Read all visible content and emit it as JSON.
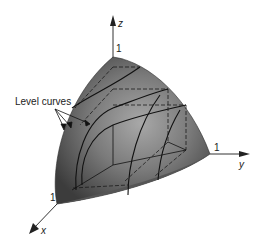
{
  "figure": {
    "annotation": "Level curves",
    "axes": {
      "x": {
        "label": "x",
        "tick": "1"
      },
      "y": {
        "label": "y",
        "tick": "1"
      },
      "z": {
        "label": "z",
        "tick": "1"
      }
    },
    "level_curve_count": 3,
    "colors": {
      "surface_dark": "#3a3a3a",
      "surface_light": "#9a9a9a",
      "curve": "#111111",
      "axis": "#333333",
      "background": "#ffffff"
    }
  }
}
